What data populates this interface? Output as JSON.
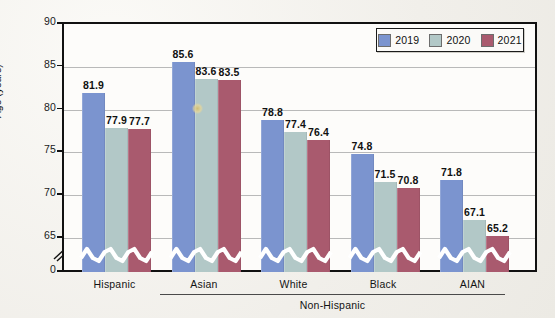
{
  "colors": {
    "series_2019": "#7b94cf",
    "series_2020": "#b2c8c7",
    "series_2021": "#a95a6e",
    "axis": "#111111",
    "grid": "#b9b9b9",
    "background": "#fdfcfa"
  },
  "legend": {
    "items": [
      {
        "label": "2019",
        "color": "#7b94cf"
      },
      {
        "label": "2020",
        "color": "#b2c8c7"
      },
      {
        "label": "2021",
        "color": "#a95a6e"
      }
    ]
  },
  "axis": {
    "ylabel": "Age (years)",
    "yticks": [
      "90",
      "85",
      "80",
      "75",
      "70",
      "65",
      "0"
    ],
    "break_symbol": "axis-break"
  },
  "group_bracket": {
    "label": "Non-Hispanic",
    "covers": [
      "Asian",
      "White",
      "Black",
      "AIAN"
    ]
  },
  "chart_data": {
    "type": "bar",
    "title": "",
    "xlabel": "",
    "ylabel": "Age (years)",
    "ylim": [
      65,
      90
    ],
    "y_axis_break": true,
    "y_axis_break_from": 0,
    "y_axis_break_to": 65,
    "yticks": [
      65,
      70,
      75,
      80,
      85,
      90
    ],
    "grid": true,
    "legend_position": "top-right",
    "categories": [
      "Hispanic",
      "Asian",
      "White",
      "Black",
      "AIAN"
    ],
    "series": [
      {
        "name": "2019",
        "color": "#7b94cf",
        "values": [
          81.9,
          85.6,
          78.8,
          74.8,
          71.8
        ]
      },
      {
        "name": "2020",
        "color": "#b2c8c7",
        "values": [
          77.9,
          83.6,
          77.4,
          71.5,
          67.1
        ]
      },
      {
        "name": "2021",
        "color": "#a95a6e",
        "values": [
          77.7,
          83.5,
          76.4,
          70.8,
          65.2
        ]
      }
    ],
    "data_labels": [
      [
        "81.9",
        "77.9",
        "77.7"
      ],
      [
        "85.6",
        "83.6",
        "83.5"
      ],
      [
        "78.8",
        "77.4",
        "76.4"
      ],
      [
        "74.8",
        "71.5",
        "70.8"
      ],
      [
        "71.8",
        "67.1",
        "65.2"
      ]
    ]
  }
}
